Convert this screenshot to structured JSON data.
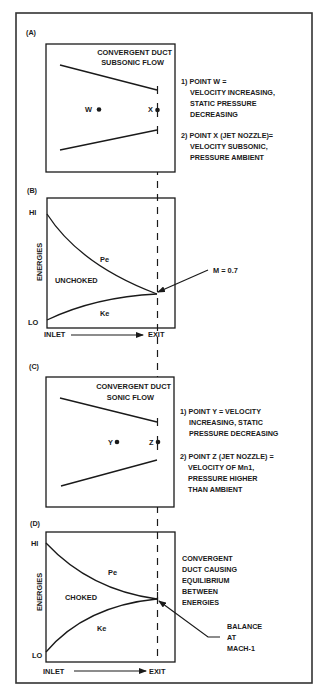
{
  "panels": {
    "a": {
      "label": "(A)",
      "title_line1": "CONVERGENT DUCT",
      "title_line2": "SUBSONIC FLOW",
      "point_w": "W",
      "point_x": "X",
      "notes": [
        "1) POINT W =",
        "VELOCITY INCREASING,",
        "STATIC PRESSURE",
        "DECREASING",
        "2) POINT X (JET NOZZLE)=",
        "VELOCITY SUBSONIC,",
        "PRESSURE AMBIENT"
      ]
    },
    "b": {
      "label": "(B)",
      "y_hi": "HI",
      "y_lo": "LO",
      "y_axis": "ENERGIES",
      "x_start": "INLET",
      "x_end": "EXIT",
      "pe": "Pe",
      "ke": "Ke",
      "state": "UNCHOKED",
      "callout": "M = 0.7"
    },
    "c": {
      "label": "(C)",
      "title_line1": "CONVERGENT DUCT",
      "title_line2": "SONIC FLOW",
      "point_y": "Y",
      "point_z": "Z",
      "notes": [
        "1) POINT Y = VELOCITY",
        "INCREASING, STATIC",
        "PRESSURE DECREASING",
        "2) POINT Z (JET NOZZLE) =",
        "VELOCITY OF Mn1,",
        "PRESSURE HIGHER",
        "THAN AMBIENT"
      ]
    },
    "d": {
      "label": "(D)",
      "y_hi": "HI",
      "y_lo": "LO",
      "y_axis": "ENERGIES",
      "x_start": "INLET",
      "x_end": "EXIT",
      "pe": "Pe",
      "ke": "Ke",
      "state": "CHOKED",
      "notes": [
        "CONVERGENT",
        "DUCT CAUSING",
        "EQUILIBRIUM",
        "BETWEEN",
        "ENERGIES"
      ],
      "callout": [
        "BALANCE",
        "AT",
        "MACH-1"
      ]
    }
  },
  "colors": {
    "line": "#1a1a1a",
    "frame": "#333333",
    "background": "#ffffff"
  }
}
